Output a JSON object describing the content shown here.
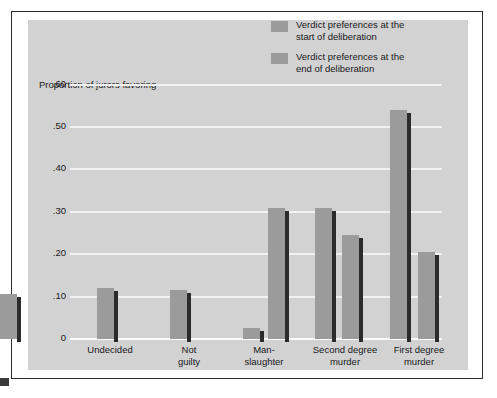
{
  "figure": {
    "y_axis_title": "Proportion of jurors favoring",
    "plot_background": "#d2d2d2",
    "bar_face_color": "#9b9b9b",
    "bar_shadow_color": "#2b2b2e",
    "frame_color": "#2b2b30",
    "gridline_color": "#f2f2f2"
  },
  "legend": {
    "items": [
      {
        "label": "Verdict preferences at the\nstart of deliberation",
        "swatch_name": "legend-swatch-start"
      },
      {
        "label": "Verdict preferences at the\nend of deliberation",
        "swatch_name": "legend-swatch-end"
      }
    ]
  },
  "chart_data": {
    "type": "bar",
    "title": "",
    "subtitle": "",
    "xlabel": "",
    "ylabel": "Proportion of jurors favoring",
    "ylim": [
      0,
      0.62
    ],
    "grid": true,
    "legend_position": "top-right",
    "ytick_labels": [
      ".60",
      ".50",
      ".40",
      ".30",
      ".20",
      ".10",
      "0"
    ],
    "ytick_values": [
      0.6,
      0.5,
      0.4,
      0.3,
      0.2,
      0.1,
      0
    ],
    "categories": [
      "Undecided",
      "Not\nguilty",
      "Man-\nslaughter",
      "Second degree\nmurder",
      "First degree\nmurder"
    ],
    "series": [
      {
        "name": "Verdict preferences at the start of deliberation",
        "values": [
          0.12,
          0.115,
          0.31,
          0.245,
          0.205
        ]
      },
      {
        "name": "Verdict preferences at the end of deliberation",
        "values": [
          null,
          0.025,
          0.31,
          0.54,
          0.105
        ]
      }
    ]
  },
  "geometry": {
    "baseline_y": 339,
    "px_per_unit": 424,
    "grid_left": 70,
    "grid_width": 372,
    "bar_width": 17,
    "bar_x": [
      97,
      170,
      243,
      268,
      315,
      342,
      390,
      418
    ],
    "label_x": [
      78,
      159,
      227,
      300,
      379
    ],
    "label_w": [
      64,
      60,
      74,
      90,
      80
    ]
  }
}
